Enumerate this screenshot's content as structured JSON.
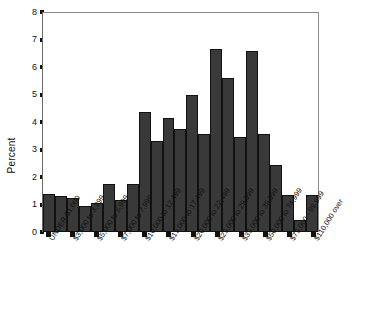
{
  "chart_data": {
    "type": "bar",
    "title": "",
    "subtitle": "",
    "xlabel": "",
    "ylabel": "Percent",
    "ylim": [
      0,
      8
    ],
    "yticks": [
      0,
      1,
      2,
      3,
      4,
      5,
      6,
      7,
      8
    ],
    "grid": false,
    "legend": null,
    "bar_color": "#393939",
    "bar_edge_color": "#111111",
    "axis_color": "#8a8a8a",
    "orientation": "vertical",
    "label_rotation_deg": -58,
    "categories": [
      "UNDER $1,000",
      "$1,000 to 1,999",
      "$2,000 to 2,999",
      "$3,000 to 3,999",
      "$4,000 to 4,999",
      "$5,000 to 5,999",
      "$6,000 to 6,999",
      "$7,000 to 7,999",
      "$8,000 to 9,999",
      "$10,000 to 12,499",
      "$12,500 to 14,999",
      "$15,000 to 17,499",
      "$17,500 to 19,999",
      "$20,000 to 22,499",
      "$22,500 to 24,999",
      "$25,000 to 29,999",
      "$30,000 to 34,999",
      "$35,000 to 39,999",
      "$40,000 to 49,999",
      "$50,000 to 74,999",
      "$75,000 - 99,999",
      "$100,000 - 109,999",
      "$110,000 over"
    ],
    "tick_labels": [
      "UNDER $1,000",
      "$3,000 to 3,999",
      "$5,000 to 5,999",
      "$7,000 to 7,999",
      "$10,000 to 12,499",
      "$15,000 to 17,499",
      "$20,000 to 22,499",
      "$25,000 to 29,999",
      "$35,000 to 39,999",
      "$50,000 to 74,999",
      "$75,000 - 99,999",
      "$110,000 over"
    ],
    "tick_label_indices": [
      0,
      2,
      4,
      6,
      8,
      10,
      12,
      14,
      16,
      18,
      20,
      22
    ],
    "values": [
      1.4,
      1.3,
      1.25,
      0.95,
      1.05,
      1.75,
      1.15,
      1.75,
      4.35,
      3.3,
      4.15,
      3.75,
      5.0,
      3.55,
      6.65,
      5.6,
      3.45,
      6.6,
      3.55,
      2.45,
      1.35,
      0.45,
      1.35
    ]
  }
}
